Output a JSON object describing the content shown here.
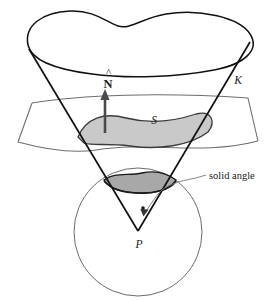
{
  "figure": {
    "background_color": "#ffffff",
    "width": 276,
    "height": 301
  },
  "colors": {
    "cone_stroke": "#111111",
    "blob_stroke": "#111111",
    "sheet_stroke": "#6e6e6e",
    "surface_fill": "#c9c9c9",
    "surface_stroke": "#3a3a3a",
    "sphere_stroke": "#5a5a5a",
    "cap_fill": "#a8a8a8",
    "cap_stroke": "#1a1a1a",
    "normal_arrow": "#4a4a4a",
    "pointer_stroke": "#777777",
    "text": "#1a1a1a"
  },
  "labels": {
    "normal_vector": "N",
    "normal_hat": "^",
    "cone": "K",
    "surface": "S",
    "apex_point": "P",
    "solid_angle": "solid angle"
  },
  "elements": {
    "blob_name": "top-boundary-blob",
    "cone_name": "cone-K",
    "sheet_name": "plane-sheet",
    "surface_name": "surface-S",
    "sphere_name": "unit-sphere",
    "cap_name": "spherical-cap",
    "normal_name": "normal-vector-arrow",
    "apex_name": "apex-point-P",
    "pointer_name": "solid-angle-pointer"
  }
}
